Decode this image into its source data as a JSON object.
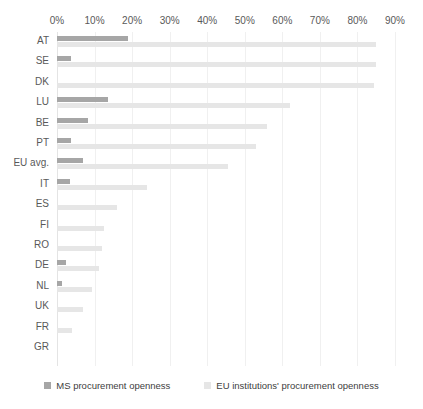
{
  "chart_data": {
    "type": "bar",
    "orientation": "horizontal",
    "title": "",
    "xlabel": "",
    "ylabel": "",
    "xlim": [
      0,
      90
    ],
    "xtick_labels": [
      "0%",
      "10%",
      "20%",
      "30%",
      "40%",
      "50%",
      "60%",
      "70%",
      "80%",
      "90%"
    ],
    "xtick_values": [
      0,
      10,
      20,
      30,
      40,
      50,
      60,
      70,
      80,
      90
    ],
    "grid": true,
    "legend_position": "bottom",
    "categories": [
      "AT",
      "SE",
      "DK",
      "LU",
      "BE",
      "PT",
      "EU avg.",
      "IT",
      "ES",
      "FI",
      "RO",
      "DE",
      "NL",
      "UK",
      "FR",
      "GR"
    ],
    "series": [
      {
        "name": "MS procurement openness",
        "color": "#a6a6a6",
        "values": [
          18.9,
          3.7,
          0.0,
          13.5,
          8.2,
          3.7,
          6.8,
          3.5,
          0.0,
          0.0,
          0.0,
          2.3,
          1.2,
          0.0,
          0.0,
          0.0
        ]
      },
      {
        "name": "EU institutions' procurement openness",
        "color": "#e6e6e6",
        "values": [
          85.0,
          85.0,
          84.5,
          62.0,
          56.0,
          53.0,
          45.5,
          24.0,
          16.0,
          12.5,
          12.0,
          11.2,
          9.2,
          6.8,
          4.0,
          0.0
        ]
      }
    ]
  },
  "legend": {
    "items": [
      {
        "label": "MS procurement openness",
        "swatch": "ms"
      },
      {
        "label": "EU institutions' procurement openness",
        "swatch": "eu"
      }
    ]
  }
}
